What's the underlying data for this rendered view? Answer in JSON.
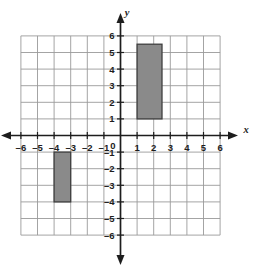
{
  "chart_data": {
    "type": "scatter",
    "title": "",
    "xlabel": "x",
    "ylabel": "y",
    "xlim": [
      -6,
      6
    ],
    "ylim": [
      -6,
      6
    ],
    "grid": true,
    "grid_step": 1,
    "legend": "none",
    "x_ticks": [
      -6,
      -5,
      -4,
      -3,
      -2,
      -1,
      1,
      2,
      3,
      4,
      5,
      6
    ],
    "x_tick_labels": [
      "–6",
      "–5",
      "–4",
      "–3",
      "–2",
      "–1",
      "1",
      "2",
      "3",
      "4",
      "5",
      "6"
    ],
    "y_ticks": [
      6,
      5,
      4,
      3,
      2,
      1,
      -1,
      -2,
      -3,
      -4,
      -5,
      -6
    ],
    "y_tick_labels": [
      "6",
      "5",
      "4",
      "3",
      "2",
      "1",
      "–1",
      "–2",
      "–3",
      "–4",
      "–5",
      "–6"
    ],
    "origin_label": "0",
    "axis_arrows": [
      "left",
      "right",
      "up",
      "down"
    ],
    "shapes": [
      {
        "name": "upper-rectangle",
        "type": "rectangle",
        "x_min": 1,
        "x_max": 2.5,
        "y_min": 1,
        "y_max": 5.5,
        "width": 1.5,
        "height": 4.5,
        "fill": "#8a8a8a",
        "stroke": "#3f3f3f",
        "vertices": [
          [
            1,
            1
          ],
          [
            2.5,
            1
          ],
          [
            2.5,
            5.5
          ],
          [
            1,
            5.5
          ]
        ]
      },
      {
        "name": "lower-left-rectangle",
        "type": "rectangle",
        "x_min": -4,
        "x_max": -3,
        "y_min": -4,
        "y_max": -1,
        "width": 1,
        "height": 3,
        "fill": "#8a8a8a",
        "stroke": "#3f3f3f",
        "vertices": [
          [
            -4,
            -4
          ],
          [
            -3,
            -4
          ],
          [
            -3,
            -1
          ],
          [
            -4,
            -1
          ]
        ]
      }
    ],
    "colors": {
      "grid_line": "#9a9a9a",
      "axis_line": "#1d1d1d",
      "shape_fill": "#8a8a8a",
      "shape_stroke": "#3f3f3f",
      "background": "#ffffff"
    }
  }
}
